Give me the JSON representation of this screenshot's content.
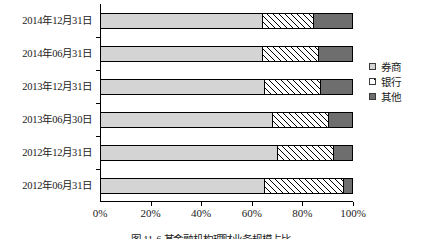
{
  "chart_data": {
    "type": "bar",
    "orientation": "horizontal",
    "stacked": true,
    "stack_mode": "percent",
    "title": "",
    "xlabel": "",
    "ylabel": "",
    "xlim": [
      0,
      100
    ],
    "grid": false,
    "legend_position": "right",
    "categories": [
      "2014年12月31日",
      "2014年06月31日",
      "2013年12月31日",
      "2013年06月30日",
      "2012年12月31日",
      "2012年06月31日"
    ],
    "xticklabels": [
      "0%",
      "20%",
      "40%",
      "60%",
      "80%",
      "100%"
    ],
    "xtickvalues": [
      0,
      20,
      40,
      60,
      80,
      100
    ],
    "series": [
      {
        "name": "券商",
        "color": "#d4d4d4",
        "pattern": "solid",
        "values": [
          64,
          64,
          65,
          68,
          70,
          65
        ]
      },
      {
        "name": "银行",
        "color": "#ffffff",
        "pattern": "hatch",
        "values": [
          20,
          22,
          22,
          22,
          22,
          31
        ]
      },
      {
        "name": "其他",
        "color": "#6e6e6e",
        "pattern": "solid",
        "values": [
          16,
          14,
          13,
          10,
          8,
          4
        ]
      }
    ]
  },
  "legend": {
    "items": [
      {
        "label": "券商"
      },
      {
        "label": "银行"
      },
      {
        "label": "其他"
      }
    ]
  },
  "caption": {
    "text": "图 11-6  某金融机构理财业务规模占比"
  }
}
